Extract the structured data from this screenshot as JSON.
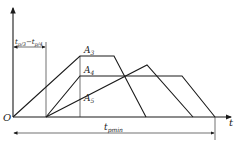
{
  "diagram": {
    "origin_label": "O",
    "x_axis_label": "t",
    "offset_dimension_label": "t_p3 − t_p4",
    "offset_dimension_main": "t",
    "offset_dimension_sub1": "p/3",
    "offset_dimension_dash": "−t",
    "offset_dimension_sub2": "p/4",
    "total_dimension_main": "t",
    "total_dimension_sub": "pmin",
    "curves": [
      {
        "name": "A3",
        "label_main": "A",
        "label_sub": "3",
        "points": [
          [
            13,
            117
          ],
          [
            80,
            56
          ],
          [
            114,
            56
          ],
          [
            146,
            117
          ]
        ]
      },
      {
        "name": "A4",
        "label_main": "A",
        "label_sub": "4",
        "points": [
          [
            46,
            117
          ],
          [
            80,
            76
          ],
          [
            182,
            76
          ],
          [
            215,
            117
          ]
        ]
      },
      {
        "name": "A5",
        "label_main": "A",
        "label_sub": "5",
        "points": [
          [
            46,
            117
          ],
          [
            147,
            65
          ],
          [
            193,
            117
          ]
        ]
      }
    ]
  }
}
